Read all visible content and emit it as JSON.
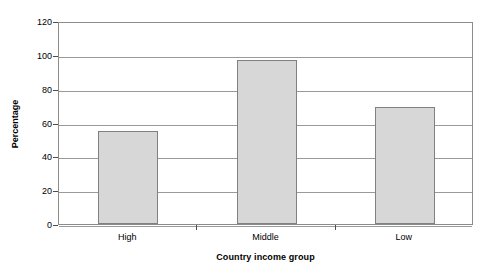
{
  "chart_data": {
    "type": "bar",
    "title": "",
    "categories": [
      "High",
      "Middle",
      "Low"
    ],
    "values": [
      55,
      97,
      69
    ],
    "xlabel": "Country income group",
    "ylabel": "Percentage",
    "ylim": [
      0,
      120
    ],
    "yticks": [
      0,
      20,
      40,
      60,
      80,
      100,
      120
    ],
    "ytick_labels": [
      "0",
      "20",
      "40",
      "60",
      "80",
      "100",
      "120"
    ],
    "grid": "horizontal",
    "legend": "none",
    "bar_fill_color": "#d7d7d7",
    "bar_border_color": "#808080",
    "gridline_color": "#9a9a9a",
    "frame_color": "#8c8c8c",
    "background_color": "#ffffff"
  }
}
